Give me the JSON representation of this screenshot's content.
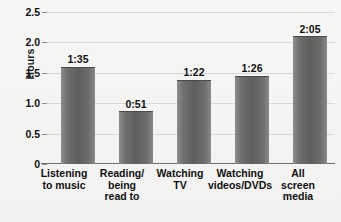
{
  "chart_data": {
    "type": "bar",
    "title": "",
    "xlabel": "",
    "ylabel": "Hours",
    "ylim": [
      0,
      2.5
    ],
    "ytick_labels": [
      "0",
      "0.5",
      "1.0",
      "1.5",
      "2.0",
      "2.5"
    ],
    "ytick_values": [
      0,
      0.5,
      1.0,
      1.5,
      2.0,
      2.5
    ],
    "grid": true,
    "legend": "none",
    "categories": [
      "Listening to music",
      "Reading/ being read to",
      "Watching TV",
      "Watching videos/DVDs",
      "All screen media"
    ],
    "category_lines": [
      [
        "Listening",
        "to music"
      ],
      [
        "Reading/",
        "being",
        "read to"
      ],
      [
        "Watching",
        "TV"
      ],
      [
        "Watching",
        "videos/DVDs"
      ],
      [
        "All",
        "screen",
        "media"
      ]
    ],
    "values": [
      1.583,
      0.85,
      1.367,
      1.433,
      2.083
    ],
    "data_labels": [
      "1:35",
      "0:51",
      "1:22",
      "1:26",
      "2:05"
    ],
    "bar_color": "#5e5e5c",
    "gridline_color": "#d8d8d6",
    "axis_color": "#6f6f6d",
    "background_color": "#f4f4f2",
    "text_color": "#111111"
  }
}
